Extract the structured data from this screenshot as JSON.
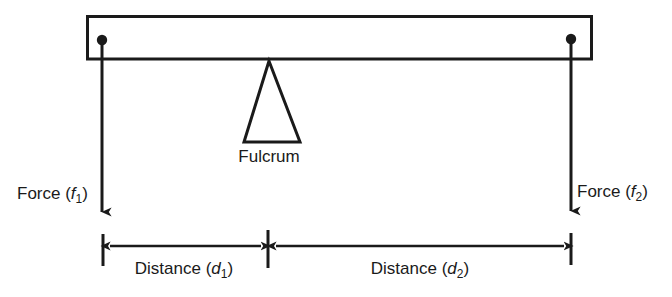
{
  "diagram": {
    "type": "mechanics-schematic",
    "background_color": "#ffffff",
    "line_color": "#1a1a1a",
    "beam": {
      "name": "lever-beam",
      "left_x": 87,
      "right_x": 592,
      "top_y": 16,
      "bottom_y": 59
    },
    "fulcrum": {
      "label": "Fulcrum",
      "apex_x": 269,
      "apex_y": 60,
      "base_left_x": 244,
      "base_right_x": 300,
      "base_y": 142,
      "label_x": 269,
      "label_y": 162
    },
    "pivots": [
      {
        "name": "left-pivot-point",
        "x": 102,
        "y": 40
      },
      {
        "name": "right-pivot-point",
        "x": 571,
        "y": 39
      }
    ],
    "forces": [
      {
        "name": "force-left",
        "label_prefix": "Force (",
        "label_symbol": "f",
        "label_subscript": "1",
        "label_suffix": ")",
        "label_full": "Force (f1)",
        "label_x": 17,
        "label_y": 199,
        "arrow_x": 102,
        "arrow_top_y": 40,
        "arrow_tip_y": 222,
        "direction": "down"
      },
      {
        "name": "force-right",
        "label_prefix": "Force (",
        "label_symbol": "f",
        "label_subscript": "2",
        "label_suffix": ")",
        "label_full": "Force (f2)",
        "label_x": 577,
        "label_y": 197,
        "arrow_x": 571,
        "arrow_top_y": 39,
        "arrow_tip_y": 221,
        "direction": "down"
      }
    ],
    "dimensions": [
      {
        "name": "distance-d1",
        "label_prefix": "Distance (",
        "label_symbol": "d",
        "label_subscript": "1",
        "label_suffix": ")",
        "label_full": "Distance (d1)",
        "label_x": 184,
        "label_y": 274,
        "start_x": 103,
        "end_x": 268,
        "line_y": 246,
        "tick_top_y": 234,
        "tick_bottom_y": 266
      },
      {
        "name": "distance-d2",
        "label_prefix": "Distance (",
        "label_symbol": "d",
        "label_subscript": "2",
        "label_suffix": ")",
        "label_full": "Distance (d2)",
        "label_x": 420,
        "label_y": 274,
        "start_x": 268,
        "end_x": 571,
        "line_y": 246,
        "tick_top_y": 230,
        "tick_bottom_y": 268
      }
    ]
  }
}
